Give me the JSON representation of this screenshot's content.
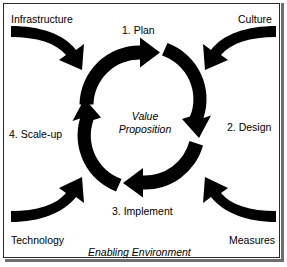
{
  "diagram": {
    "center_label_line1": "Value",
    "center_label_line2": "Proposition",
    "footer_label": "Enabling Environment",
    "stroke_color": "#000000",
    "background_color": "#ffffff",
    "border_color": "#2a2a2a",
    "cycle_steps": [
      {
        "id": "plan",
        "label": "1. Plan",
        "position": "top"
      },
      {
        "id": "design",
        "label": "2. Design",
        "position": "right"
      },
      {
        "id": "implement",
        "label": "3. Implement",
        "position": "bottom"
      },
      {
        "id": "scale-up",
        "label": "4. Scale-up",
        "position": "left"
      }
    ],
    "enablers": [
      {
        "id": "infrastructure",
        "label": "Infrastructure",
        "position": "top-left"
      },
      {
        "id": "culture",
        "label": "Culture",
        "position": "top-right"
      },
      {
        "id": "technology",
        "label": "Technology",
        "position": "bottom-left"
      },
      {
        "id": "measures",
        "label": "Measures",
        "position": "bottom-right"
      }
    ],
    "cycle_direction": "clockwise",
    "cycle_arrow_count": 4,
    "enabler_arrow_count": 4
  }
}
